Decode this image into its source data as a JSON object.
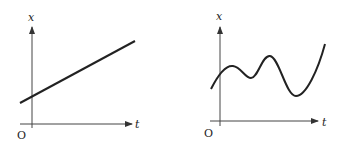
{
  "diagrams": [
    {
      "name": "linear-graph",
      "y_axis_label": "x",
      "x_axis_label": "t",
      "origin_label": "O",
      "curve": "straight line with positive slope and positive intercept"
    },
    {
      "name": "oscillating-graph",
      "y_axis_label": "x",
      "x_axis_label": "t",
      "origin_label": "O",
      "curve": "wavy curve with two local maxima and two local minima, rising steeply at end"
    }
  ],
  "colors": {
    "line": "#222222",
    "axis": "#444444"
  }
}
